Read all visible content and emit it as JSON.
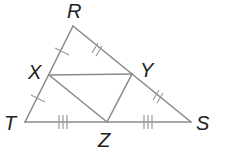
{
  "diagram": {
    "type": "triangle-midsegments",
    "line_color": "#8a8a8a",
    "label_color": "#222222",
    "points": {
      "R": {
        "label": "R",
        "x": 73,
        "y": 26
      },
      "T": {
        "label": "T",
        "x": 25,
        "y": 122
      },
      "S": {
        "label": "S",
        "x": 191,
        "y": 122
      },
      "X": {
        "label": "X",
        "x": 49,
        "y": 75
      },
      "Y": {
        "label": "Y",
        "x": 132,
        "y": 74
      },
      "Z": {
        "label": "Z",
        "x": 107,
        "y": 122
      }
    },
    "segments": [
      "RT",
      "RS",
      "TS",
      "XY",
      "XZ",
      "YZ"
    ],
    "tick_marks": [
      {
        "segment": "RX",
        "count": 1
      },
      {
        "segment": "XT",
        "count": 1
      },
      {
        "segment": "RY",
        "count": 2
      },
      {
        "segment": "YS",
        "count": 2
      },
      {
        "segment": "TZ",
        "count": 3
      },
      {
        "segment": "ZS",
        "count": 3
      }
    ]
  }
}
